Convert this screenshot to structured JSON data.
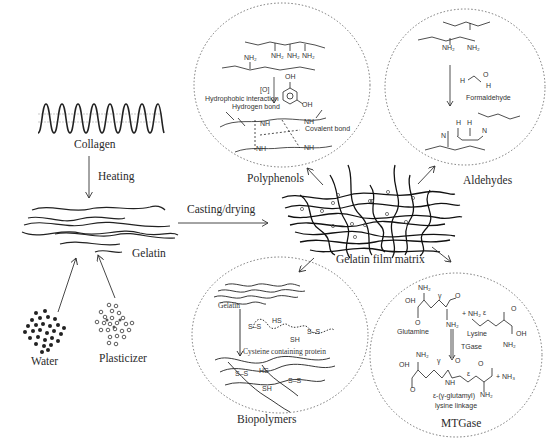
{
  "diagram": {
    "type": "process-flow",
    "nodes": {
      "collagen": {
        "label": "Collagen"
      },
      "gelatin": {
        "label": "Gelatin"
      },
      "water": {
        "label": "Water"
      },
      "plasticizer": {
        "label": "Plasticizer"
      },
      "film_matrix": {
        "label": "Gelatin film matrix"
      },
      "polyphenols": {
        "label": "Polyphenols"
      },
      "aldehydes": {
        "label": "Aldehydes"
      },
      "biopolymers": {
        "label": "Biopolymers"
      },
      "mtgase": {
        "label": "MTGase"
      }
    },
    "edges": {
      "heating": {
        "label": "Heating"
      },
      "casting": {
        "label": "Casting/drying"
      }
    },
    "polyphenols_detail": {
      "nh2": "NH₂",
      "oxidation": "[O]",
      "oh": "OH",
      "hydrophobic": "Hydrophobic interaction",
      "hydrogen_bond": "Hydrogen bond",
      "covalent_bond": "Covalent bond",
      "nh": "NH"
    },
    "aldehydes_detail": {
      "nh2": "NH₂",
      "formaldehyde": "Formaldehyde",
      "formula_h": "H",
      "formula_c": "C",
      "formula_o": "O",
      "n": "N"
    },
    "biopolymers_detail": {
      "gelatin": "Gelatin",
      "cysteine": "Cysteine containing protein",
      "ss": "S–S",
      "hs": "HS",
      "sh": "SH"
    },
    "mtgase_detail": {
      "nh2": "NH₂",
      "oh": "OH",
      "o": "O",
      "gamma": "γ",
      "epsilon": "ε",
      "glutamine": "Glutamine",
      "lysine": "Lysine",
      "plus_nh2": "+ NH₂",
      "tgase": "TGase",
      "nh": "NH",
      "plus_nh3": "+ NH₃",
      "linkage_1": "ε-(γ-glutamyl)",
      "linkage_2": "lysine linkage"
    }
  }
}
